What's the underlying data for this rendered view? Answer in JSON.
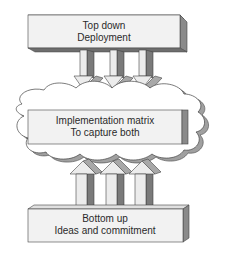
{
  "diagram": {
    "top_box": {
      "line1": "Top down",
      "line2": "Deployment"
    },
    "middle_box": {
      "line1": "Implementation matrix",
      "line2": "To capture both"
    },
    "bottom_box": {
      "line1": "Bottom up",
      "line2": "Ideas and commitment"
    },
    "down_arrow_count": 3,
    "up_arrow_count": 3,
    "colors": {
      "box_face": "#f2f2f2",
      "box_side": "#8a8a8a",
      "box_top": "#d8d8d8",
      "arrow_light": "#ececec",
      "arrow_dark": "#7a7a7a",
      "arrow_mid": "#a8a8a8",
      "outline": "#444444",
      "cloud_fill": "#ffffff"
    }
  }
}
